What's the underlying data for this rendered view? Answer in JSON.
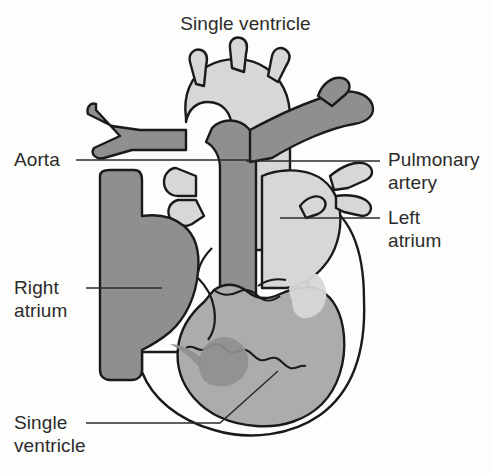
{
  "figure": {
    "title": "Single ventricle",
    "type": "anatomical-diagram",
    "labels": {
      "aorta": "Aorta",
      "pulmonary_artery": "Pulmonary\nartery",
      "left_atrium": "Left\natrium",
      "right_atrium": "Right\natrium",
      "single_ventricle": "Single\nventricle"
    },
    "colors": {
      "background": "#fdfdfc",
      "outline": "#1a1a1a",
      "deoxygenated_dark_gray": "#8f8f8f",
      "oxygenated_light_gray": "#d7d7d7",
      "mixed_medium_gray": "#acacac",
      "text": "#2b2b2b",
      "leader_line": "#2b2b2b"
    }
  }
}
